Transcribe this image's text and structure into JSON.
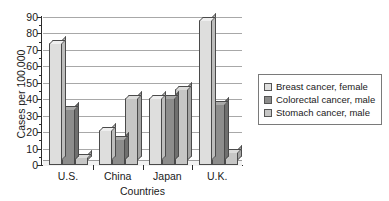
{
  "chart_data": {
    "type": "bar",
    "title": "",
    "subtitle": "",
    "xlabel": "Countries",
    "ylabel": "Cases per 100,000",
    "categories": [
      "U.S.",
      "China",
      "Japan",
      "U.K."
    ],
    "series": [
      {
        "name": "Breast cancer, female",
        "color": "#dededd",
        "values": [
          74,
          21,
          41,
          88
        ]
      },
      {
        "name": "Colorectal cancer, male",
        "color": "#8d8d8c",
        "values": [
          34,
          16,
          41,
          37
        ]
      },
      {
        "name": "Stomach cancer, male",
        "color": "#c6c6c5",
        "values": [
          5,
          41,
          46,
          8
        ]
      }
    ],
    "ylim": [
      0,
      90
    ],
    "ytick_values": [
      0,
      10,
      20,
      30,
      40,
      50,
      60,
      70,
      80,
      90
    ],
    "ytick_labels": [
      "0",
      "10",
      "20",
      "30",
      "40",
      "50",
      "60",
      "70",
      "80",
      "90"
    ],
    "grid": true,
    "grid_axis": "y",
    "legend_position": "right",
    "legend_entries": [
      "Breast cancer, female",
      "Colorectal cancer, male",
      "Stomach cancer, male"
    ],
    "annotations": [],
    "style": "3d-bar"
  }
}
